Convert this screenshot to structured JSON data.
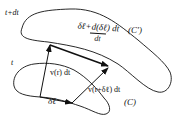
{
  "diagram": {
    "type": "vector-kinematics-material-line",
    "curves": [
      {
        "name": "C",
        "label": "(C)",
        "time_label": "t"
      },
      {
        "name": "C-prime",
        "label": "(C')",
        "time_label": "t+dt"
      }
    ],
    "vectors": [
      {
        "name": "delta-l",
        "label": "δℓ",
        "from": "A",
        "to": "B"
      },
      {
        "name": "v-r-dt",
        "label": "v(r) dt",
        "from": "A",
        "to": "D"
      },
      {
        "name": "v-r-plus-dl-dt",
        "label": "v(r+δℓ) dt",
        "from": "B",
        "to": "C"
      },
      {
        "name": "delta-l-new",
        "label": "δℓ+d(δℓ) dt / dt",
        "from": "D",
        "to": "C"
      }
    ]
  },
  "labels": {
    "t_plus_dt": "t+dt",
    "t": "t",
    "curve_c_prime": "(C')",
    "curve_c": "(C)",
    "delta_l": "δℓ",
    "v_r_dt": "v(r) dt",
    "v_r_plus": "v(r+δℓ) dt",
    "top_num": "δℓ+d(δℓ) dt",
    "top_den": "dt"
  },
  "colors": {
    "ink": "#111111",
    "background": "#ffffff"
  }
}
